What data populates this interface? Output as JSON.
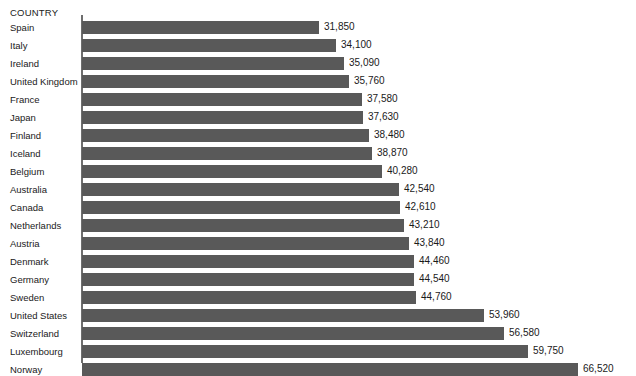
{
  "chart_data": {
    "type": "bar",
    "orientation": "horizontal",
    "title": "",
    "subtitle": "",
    "xlabel": "",
    "ylabel": "COUNTRY",
    "grid": false,
    "legend": null,
    "axis_range": [
      0,
      66520
    ],
    "value_format": "comma-separated thousands",
    "categories": [
      "Spain",
      "Italy",
      "Ireland",
      "United Kingdom",
      "France",
      "Japan",
      "Finland",
      "Iceland",
      "Belgium",
      "Australia",
      "Canada",
      "Netherlands",
      "Austria",
      "Denmark",
      "Germany",
      "Sweden",
      "United States",
      "Switzerland",
      "Luxembourg",
      "Norway"
    ],
    "values": [
      31850,
      34100,
      35090,
      35760,
      37580,
      37630,
      38480,
      38870,
      40280,
      42540,
      42610,
      43210,
      43840,
      44460,
      44540,
      44760,
      53960,
      56580,
      59750,
      66520
    ],
    "value_labels": [
      "31,850",
      "34,100",
      "35,090",
      "35,760",
      "37,580",
      "37,630",
      "38,480",
      "38,870",
      "40,280",
      "42,540",
      "42,610",
      "43,210",
      "43,840",
      "44,460",
      "44,540",
      "44,760",
      "53,960",
      "56,580",
      "59,750",
      "66,520"
    ],
    "colors": {
      "bar": "#595959",
      "axis": "#6e6e6e",
      "text": "#1a1a1a",
      "background": "#ffffff"
    }
  },
  "header": {
    "category_column_label": "COUNTRY"
  }
}
